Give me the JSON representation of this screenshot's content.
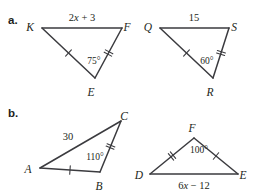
{
  "page": {
    "background": "#ffffff",
    "ink_color": "#231f20",
    "line_color": "#3b3b3f",
    "width": 259,
    "height": 196
  },
  "parts": [
    {
      "key": "a",
      "label": "a.",
      "label_x": 8,
      "label_y": 24,
      "figures": [
        {
          "key": "kfe",
          "name": "triangle-kfe",
          "vertices": [
            {
              "name": "K",
              "x": 42,
              "y": 28,
              "label": "K",
              "label_x": 30,
              "label_y": 28
            },
            {
              "name": "F",
              "x": 122,
              "y": 28,
              "label": "F",
              "label_x": 127,
              "label_y": 28
            },
            {
              "name": "E",
              "x": 95,
              "y": 78,
              "label": "E",
              "label_x": 91,
              "label_y": 93
            }
          ],
          "sides": [
            {
              "name": "KF",
              "from": "K",
              "to": "F",
              "ticks": 0
            },
            {
              "name": "KE",
              "from": "K",
              "to": "E",
              "ticks": 1
            },
            {
              "name": "FE",
              "from": "F",
              "to": "E",
              "ticks": 2
            }
          ],
          "side_labels": [
            {
              "name": "side-label-kf",
              "text": "2x + 3",
              "var": "x",
              "prefix": "2",
              "suffix": " + 3",
              "x": 82,
              "y": 21
            }
          ],
          "angle_labels": [
            {
              "name": "angle-label-e",
              "text": "75°",
              "x": 94,
              "y": 64
            }
          ]
        },
        {
          "key": "qsr",
          "name": "triangle-qsr",
          "vertices": [
            {
              "name": "Q",
              "x": 160,
              "y": 28,
              "label": "Q",
              "label_x": 148,
              "label_y": 28
            },
            {
              "name": "S",
              "x": 229,
              "y": 28,
              "label": "S",
              "label_x": 234,
              "label_y": 28
            },
            {
              "name": "R",
              "x": 213,
              "y": 78,
              "label": "R",
              "label_x": 210,
              "label_y": 93
            }
          ],
          "sides": [
            {
              "name": "QS",
              "from": "Q",
              "to": "S",
              "ticks": 0
            },
            {
              "name": "QR",
              "from": "Q",
              "to": "R",
              "ticks": 1
            },
            {
              "name": "SR",
              "from": "S",
              "to": "R",
              "ticks": 2
            }
          ],
          "side_labels": [
            {
              "name": "side-label-qs",
              "text": "15",
              "x": 194,
              "y": 21
            }
          ],
          "angle_labels": [
            {
              "name": "angle-label-r",
              "text": "60°",
              "x": 207,
              "y": 64
            }
          ]
        }
      ]
    },
    {
      "key": "b",
      "label": "b.",
      "label_x": 8,
      "label_y": 117,
      "figures": [
        {
          "key": "abc",
          "name": "triangle-abc",
          "vertices": [
            {
              "name": "A",
              "x": 40,
              "y": 168,
              "label": "A",
              "label_x": 28,
              "label_y": 170
            },
            {
              "name": "B",
              "x": 100,
              "y": 172,
              "label": "B",
              "label_x": 99,
              "label_y": 187
            },
            {
              "name": "C",
              "x": 121,
              "y": 121,
              "label": "C",
              "label_x": 124,
              "label_y": 117
            }
          ],
          "sides": [
            {
              "name": "AC",
              "from": "A",
              "to": "C",
              "ticks": 0
            },
            {
              "name": "AB",
              "from": "A",
              "to": "B",
              "ticks": 1
            },
            {
              "name": "BC",
              "from": "B",
              "to": "C",
              "ticks": 2
            }
          ],
          "side_labels": [
            {
              "name": "side-label-ac",
              "text": "30",
              "x": 68,
              "y": 140
            }
          ],
          "angle_labels": [
            {
              "name": "angle-label-b",
              "text": "110°",
              "x": 95,
              "y": 160
            }
          ]
        },
        {
          "key": "def",
          "name": "triangle-def",
          "vertices": [
            {
              "name": "D",
              "x": 150,
              "y": 174,
              "label": "D",
              "label_x": 139,
              "label_y": 176
            },
            {
              "name": "E",
              "x": 238,
              "y": 174,
              "label": "E",
              "label_x": 243,
              "label_y": 176
            },
            {
              "name": "F",
              "x": 194,
              "y": 138,
              "label": "F",
              "label_x": 192,
              "label_y": 129
            }
          ],
          "sides": [
            {
              "name": "DE",
              "from": "D",
              "to": "E",
              "ticks": 0
            },
            {
              "name": "DF",
              "from": "D",
              "to": "F",
              "ticks": 2
            },
            {
              "name": "FE",
              "from": "F",
              "to": "E",
              "ticks": 1
            }
          ],
          "side_labels": [
            {
              "name": "side-label-de",
              "text": "6x − 12",
              "var": "x",
              "prefix": "6",
              "suffix": " − 12",
              "x": 194,
              "y": 189
            }
          ],
          "angle_labels": [
            {
              "name": "angle-label-f",
              "text": "100°",
              "x": 199,
              "y": 153
            }
          ]
        }
      ]
    }
  ]
}
